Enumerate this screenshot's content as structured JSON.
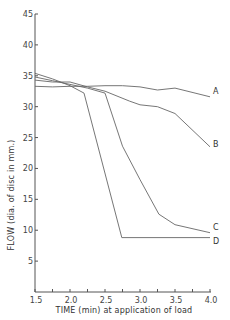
{
  "chart_data": {
    "type": "line",
    "title": "",
    "xlabel": "TIME (min) at application of load",
    "ylabel": "FLOW (dia. of disc in mm.)",
    "xlim": [
      1.5,
      4.0
    ],
    "ylim": [
      0,
      45
    ],
    "x_ticks": [
      1.5,
      1.75,
      2.0,
      2.25,
      2.5,
      2.75,
      3.0,
      3.25,
      3.5,
      3.75,
      4.0
    ],
    "x_tick_labels": [
      "1.5",
      "2.0",
      "2.5",
      "3.0",
      "3.5",
      "4.0"
    ],
    "x_tick_label_values": [
      1.5,
      2.0,
      2.5,
      3.0,
      3.5,
      4.0
    ],
    "y_ticks": [
      5,
      10,
      15,
      20,
      25,
      30,
      35,
      40,
      45
    ],
    "y_tick_labels": [
      "5",
      "10",
      "15",
      "20",
      "25",
      "30",
      "35",
      "40",
      "45"
    ],
    "grid": false,
    "legend": "inline labels at line ends (right)",
    "series": [
      {
        "name": "A",
        "x": [
          1.5,
          1.75,
          2.0,
          2.25,
          2.5,
          2.75,
          3.0,
          3.25,
          3.5,
          4.0
        ],
        "values": [
          33.3,
          33.2,
          33.3,
          33.3,
          33.4,
          33.4,
          33.2,
          32.7,
          33.0,
          31.6
        ]
      },
      {
        "name": "B",
        "x": [
          1.5,
          1.75,
          2.0,
          2.25,
          2.5,
          2.85,
          3.0,
          3.25,
          3.5,
          4.0
        ],
        "values": [
          34.3,
          34.0,
          34.0,
          33.2,
          32.5,
          30.9,
          30.3,
          30.0,
          28.9,
          23.5
        ]
      },
      {
        "name": "C",
        "x": [
          1.5,
          1.75,
          2.0,
          2.25,
          2.5,
          2.75,
          3.0,
          3.27,
          3.5,
          4.0
        ],
        "values": [
          34.8,
          34.2,
          33.6,
          33.0,
          32.2,
          23.6,
          18.2,
          12.6,
          10.9,
          9.6
        ]
      },
      {
        "name": "D",
        "x": [
          1.5,
          1.75,
          2.0,
          2.2,
          2.74,
          3.0,
          3.5,
          4.0
        ],
        "values": [
          35.4,
          34.5,
          33.4,
          32.2,
          8.8,
          8.8,
          8.8,
          8.8
        ]
      }
    ]
  }
}
